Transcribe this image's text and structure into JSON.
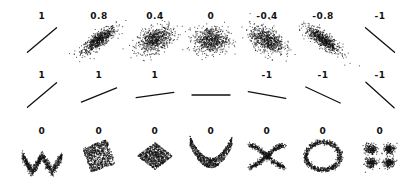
{
  "chart_data": {
    "type": "scatter",
    "title": "",
    "grid": false,
    "axes_visible": false,
    "ink_color": "#111111",
    "background": "#ffffff",
    "rows": [
      {
        "name": "noise-varying",
        "panels": [
          {
            "label": "1",
            "r": 1,
            "shape": "line",
            "slope": 1
          },
          {
            "label": "0.8",
            "r": 0.8,
            "shape": "gaussian"
          },
          {
            "label": "0.4",
            "r": 0.4,
            "shape": "gaussian"
          },
          {
            "label": "0",
            "r": 0,
            "shape": "gaussian"
          },
          {
            "label": "-0.4",
            "r": -0.4,
            "shape": "gaussian"
          },
          {
            "label": "-0.8",
            "r": -0.8,
            "shape": "gaussian"
          },
          {
            "label": "-1",
            "r": -1,
            "shape": "line",
            "slope": -1
          }
        ]
      },
      {
        "name": "slope-varying",
        "panels": [
          {
            "label": "1",
            "r": 1,
            "shape": "line",
            "angle_deg": 40
          },
          {
            "label": "1",
            "r": 1,
            "shape": "line",
            "angle_deg": 22
          },
          {
            "label": "1",
            "r": 1,
            "shape": "line",
            "angle_deg": 8
          },
          {
            "label": "",
            "r": null,
            "shape": "line",
            "angle_deg": 0
          },
          {
            "label": "-1",
            "r": -1,
            "shape": "line",
            "angle_deg": -10
          },
          {
            "label": "-1",
            "r": -1,
            "shape": "line",
            "angle_deg": -25
          },
          {
            "label": "-1",
            "r": -1,
            "shape": "line",
            "angle_deg": -42
          }
        ]
      },
      {
        "name": "nonlinear",
        "panels": [
          {
            "label": "0",
            "r": 0,
            "shape": "w-wave"
          },
          {
            "label": "0",
            "r": 0,
            "shape": "rotated-square"
          },
          {
            "label": "0",
            "r": 0,
            "shape": "diamond"
          },
          {
            "label": "0",
            "r": 0,
            "shape": "parabola"
          },
          {
            "label": "0",
            "r": 0,
            "shape": "x-cross"
          },
          {
            "label": "0",
            "r": 0,
            "shape": "ring"
          },
          {
            "label": "0",
            "r": 0,
            "shape": "four-clusters"
          }
        ]
      }
    ]
  },
  "layout": {
    "col_x": [
      42,
      99,
      155,
      211,
      267,
      323,
      380
    ],
    "label_y": [
      11,
      70,
      126
    ],
    "plot_y": [
      40,
      95,
      156
    ]
  }
}
